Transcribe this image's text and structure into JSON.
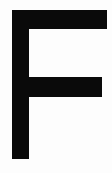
{
  "image": {
    "kind": "scanned-glyph",
    "subject": "letter-f",
    "character": "F",
    "description": "Bold sans-serif capital letter F in black on a white background",
    "alt_text": "Capital letter F",
    "width": 112,
    "height": 173,
    "background_color": "#fdfdfd",
    "ink_color": "#0a0a0a"
  },
  "glyph": {
    "character": "F",
    "case": "uppercase",
    "weight": "bold",
    "style": "sans-serif",
    "strokes": [
      {
        "name": "stem",
        "orientation": "vertical",
        "x": 12,
        "y": 10,
        "width": 17,
        "height": 149
      },
      {
        "name": "arm-top",
        "orientation": "horizontal",
        "x": 12,
        "y": 10,
        "width": 95,
        "height": 19
      },
      {
        "name": "arm-middle",
        "orientation": "horizontal",
        "x": 12,
        "y": 77,
        "width": 90,
        "height": 20
      }
    ],
    "bounding_box": {
      "left": 12,
      "top": 10,
      "right": 107,
      "bottom": 159
    }
  }
}
